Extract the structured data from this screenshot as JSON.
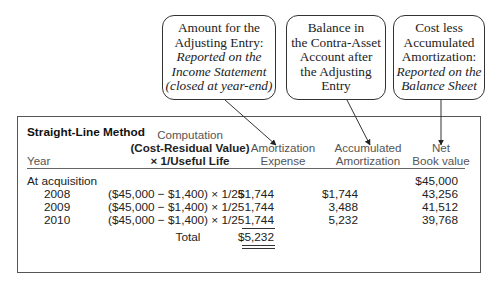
{
  "callouts": [
    {
      "lines": [
        "Amount for the",
        "Adjusting Entry:"
      ],
      "italic_lines": [
        "Reported on the",
        "Income Statement",
        "(closed at year-end)"
      ]
    },
    {
      "lines": [
        "Balance in",
        "the Contra-Asset",
        "Account after",
        "the Adjusting",
        "Entry"
      ],
      "italic_lines": []
    },
    {
      "lines": [
        "Cost less",
        "Accumulated",
        "Amortization:"
      ],
      "italic_lines": [
        "Reported on the",
        "Balance Sheet"
      ]
    }
  ],
  "table": {
    "title": "Straight-Line Method",
    "headers": {
      "year": "Year",
      "computation_line1": "Computation",
      "computation_line2": "(Cost-Residual Value)",
      "computation_line3": "× 1/Useful Life",
      "expense_line1": "Amortization",
      "expense_line2": "Expense",
      "accumulated_line1": "Accumulated",
      "accumulated_line2": "Amortization",
      "nbv_line1": "Net",
      "nbv_line2": "Book value"
    },
    "rows": [
      {
        "year": "At acquisition",
        "computation": "",
        "expense": "",
        "accumulated": "",
        "nbv": "$45,000"
      },
      {
        "year": "2008",
        "computation": "($45,000 − $1,400) × 1/25",
        "expense": "$1,744",
        "accumulated": "$1,744",
        "nbv": "43,256"
      },
      {
        "year": "2009",
        "computation": "($45,000 − $1,400) × 1/25",
        "expense": "1,744",
        "accumulated": "3,488",
        "nbv": "41,512"
      },
      {
        "year": "2010",
        "computation": "($45,000 − $1,400) × 1/25",
        "expense": "1,744",
        "accumulated": "5,232",
        "nbv": "39,768"
      }
    ],
    "total_label": "Total",
    "total_expense": "$5,232"
  }
}
